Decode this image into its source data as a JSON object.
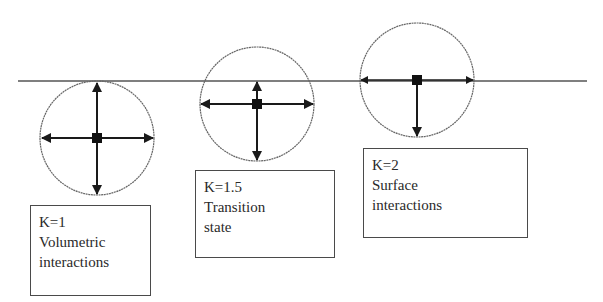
{
  "diagram": {
    "surface_line": {
      "x1": 18,
      "x2": 587,
      "y": 81,
      "color": "#555555"
    },
    "colors": {
      "circle": "#666666",
      "arrow": "#1a1a1a",
      "box_border": "#4a4a4a",
      "text": "#2a2a2a"
    },
    "states": [
      {
        "id": "volumetric",
        "k_label": "K=1",
        "line1": "Volumetric",
        "line2": "interactions",
        "circle": {
          "cx": 97,
          "cy": 138,
          "r": 57
        },
        "arrows": [
          "up",
          "down",
          "left",
          "right"
        ]
      },
      {
        "id": "transition",
        "k_label": "K=1.5",
        "line1": "Transition",
        "line2": "state",
        "circle": {
          "cx": 257,
          "cy": 104,
          "r": 57
        },
        "arrows": [
          "up-to-surface",
          "down",
          "left",
          "right"
        ]
      },
      {
        "id": "surface",
        "k_label": "K=2",
        "line1": "Surface",
        "line2": "interactions",
        "circle": {
          "cx": 417,
          "cy": 81,
          "r": 57
        },
        "arrows": [
          "down",
          "left",
          "right"
        ]
      }
    ]
  }
}
